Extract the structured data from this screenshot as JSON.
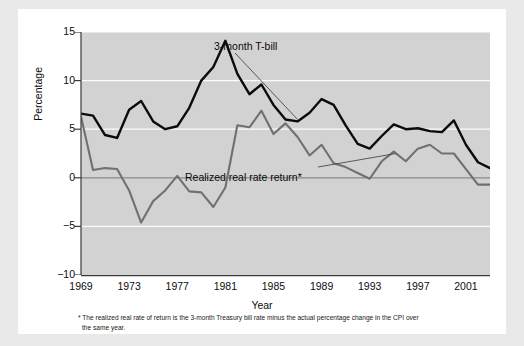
{
  "figure": {
    "y_axis_title": "Percentage",
    "x_axis_title": "Year",
    "series_label_tbill": "3-month T-bill",
    "series_label_real": "Realized real rate return*",
    "footnote_line1": "* The realized real rate of return is the 3-month Treasury bill rate minus the actual percentage change in the CPI over",
    "footnote_line2": "the same year."
  },
  "chart_data": {
    "type": "line",
    "title": "",
    "xlabel": "Year",
    "ylabel": "Percentage",
    "xlim": [
      1969,
      2003
    ],
    "ylim": [
      -10,
      15
    ],
    "yticks": [
      15,
      10,
      5,
      0,
      -5,
      -10
    ],
    "ytick_labels": [
      "15",
      "10",
      "5",
      "0",
      "−5",
      "−10"
    ],
    "xticks": [
      1969,
      1973,
      1977,
      1981,
      1985,
      1989,
      1993,
      1997,
      2001
    ],
    "xtick_labels": [
      "1969",
      "1973",
      "1977",
      "1981",
      "1985",
      "1989",
      "1993",
      "1997",
      "2001"
    ],
    "grid": "horizontal-white",
    "zero_line": true,
    "legend": "inline-annotations",
    "x": [
      1969,
      1970,
      1971,
      1972,
      1973,
      1974,
      1975,
      1976,
      1977,
      1978,
      1979,
      1980,
      1981,
      1982,
      1983,
      1984,
      1985,
      1986,
      1987,
      1988,
      1989,
      1990,
      1991,
      1992,
      1993,
      1994,
      1995,
      1996,
      1997,
      1998,
      1999,
      2000,
      2001,
      2002,
      2003
    ],
    "series": [
      {
        "name": "3-month T-bill",
        "color": "#0b0b0b",
        "values": [
          6.6,
          6.4,
          4.4,
          4.1,
          7.0,
          7.9,
          5.8,
          5.0,
          5.3,
          7.2,
          10.0,
          11.4,
          14.1,
          10.7,
          8.6,
          9.6,
          7.5,
          6.0,
          5.8,
          6.7,
          8.1,
          7.5,
          5.4,
          3.5,
          3.0,
          4.3,
          5.5,
          5.0,
          5.1,
          4.8,
          4.7,
          5.9,
          3.4,
          1.6,
          1.0
        ]
      },
      {
        "name": "Realized real rate return*",
        "color": "#707070",
        "values": [
          6.3,
          0.8,
          1.0,
          0.9,
          -1.3,
          -4.6,
          -2.4,
          -1.3,
          0.2,
          -1.4,
          -1.5,
          -3.0,
          -1.0,
          5.4,
          5.2,
          6.9,
          4.5,
          5.6,
          4.2,
          2.3,
          3.4,
          1.5,
          1.1,
          0.5,
          -0.1,
          1.7,
          2.7,
          1.7,
          3.0,
          3.4,
          2.5,
          2.5,
          0.9,
          -0.7,
          -0.7
        ]
      }
    ]
  }
}
